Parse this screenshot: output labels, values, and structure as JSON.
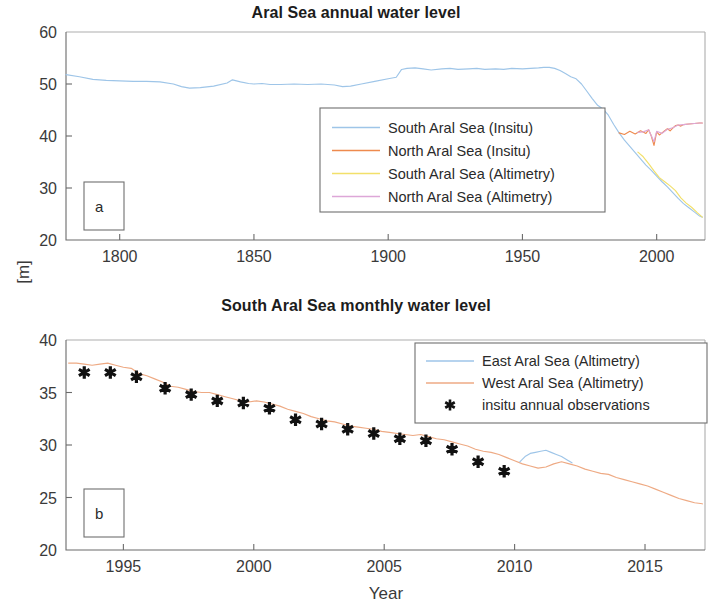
{
  "figure": {
    "ylabel": "[m]",
    "xlabel": "Year"
  },
  "panel_a": {
    "tag": "a",
    "title": "Aral Sea annual water level",
    "legend": [
      {
        "label": "South Aral Sea (Insitu)",
        "color": "#9ec5e8",
        "marker": "line"
      },
      {
        "label": "North Aral Sea (Insitu)",
        "color": "#ee8a4e",
        "marker": "line"
      },
      {
        "label": "South Aral Sea (Altimetry)",
        "color": "#f2e06a",
        "marker": "line"
      },
      {
        "label": "North Aral Sea (Altimetry)",
        "color": "#dda7d8",
        "marker": "line"
      }
    ]
  },
  "panel_b": {
    "tag": "b",
    "title": "South Aral Sea monthly water level",
    "legend": [
      {
        "label": "East Aral Sea (Altimetry)",
        "color": "#9ec5e8",
        "marker": "line"
      },
      {
        "label": "West Aral Sea (Altimetry)",
        "color": "#eeaa84",
        "marker": "line"
      },
      {
        "label": "insitu annual observations",
        "color": "#111111",
        "marker": "star"
      }
    ]
  },
  "chart_data": [
    {
      "type": "line",
      "panel": "a",
      "title": "Aral Sea annual water level",
      "xlabel": "",
      "ylabel": "[m]",
      "xlim": [
        1780,
        2018
      ],
      "ylim": [
        20,
        60
      ],
      "xticks": [
        1800,
        1850,
        1900,
        1950,
        2000
      ],
      "yticks": [
        20,
        30,
        40,
        50,
        60
      ],
      "grid": false,
      "legend_position": "center-right",
      "series": [
        {
          "name": "South Aral Sea (Insitu)",
          "color": "#9ec5e8",
          "x": [
            1780,
            1785,
            1790,
            1795,
            1800,
            1805,
            1810,
            1815,
            1820,
            1823,
            1826,
            1830,
            1835,
            1840,
            1842,
            1845,
            1848,
            1850,
            1853,
            1856,
            1860,
            1865,
            1870,
            1875,
            1880,
            1883,
            1886,
            1890,
            1895,
            1900,
            1903,
            1905,
            1907,
            1910,
            1913,
            1916,
            1920,
            1923,
            1926,
            1930,
            1933,
            1936,
            1940,
            1943,
            1946,
            1950,
            1953,
            1956,
            1958,
            1960,
            1962,
            1964,
            1966,
            1968,
            1970,
            1972,
            1974,
            1976,
            1978,
            1980,
            1982,
            1984,
            1986,
            1988,
            1990,
            1992,
            1994,
            1996,
            1998,
            2000,
            2002,
            2004,
            2006,
            2008,
            2010,
            2012,
            2014,
            2016,
            2017
          ],
          "y": [
            51.8,
            51.4,
            50.9,
            50.7,
            50.6,
            50.5,
            50.5,
            50.4,
            50.0,
            49.5,
            49.2,
            49.3,
            49.6,
            50.2,
            50.8,
            50.4,
            50.1,
            50.0,
            50.1,
            49.9,
            49.9,
            50.0,
            49.9,
            50.0,
            49.8,
            49.5,
            49.6,
            50.0,
            50.5,
            51.0,
            51.3,
            52.8,
            53.0,
            53.1,
            52.9,
            52.7,
            52.9,
            53.0,
            52.8,
            52.9,
            53.0,
            52.8,
            52.9,
            52.8,
            53.0,
            52.9,
            53.0,
            53.1,
            53.2,
            53.2,
            53.0,
            52.6,
            52.0,
            51.4,
            51.0,
            50.0,
            48.6,
            47.2,
            45.9,
            45.2,
            44.0,
            42.2,
            40.6,
            39.2,
            38.0,
            36.8,
            35.6,
            34.4,
            33.4,
            32.3,
            31.2,
            30.2,
            29.1,
            28.0,
            27.0,
            26.2,
            25.4,
            24.6,
            24.4
          ]
        },
        {
          "name": "North Aral Sea (Insitu)",
          "color": "#ee8a4e",
          "x": [
            1986,
            1988,
            1990,
            1992,
            1994,
            1996,
            1997,
            1998,
            1999,
            2000,
            2001,
            2002,
            2003,
            2004,
            2005,
            2006,
            2007,
            2008,
            2009,
            2010,
            2012,
            2014,
            2016,
            2017
          ],
          "y": [
            40.6,
            40.3,
            40.9,
            40.4,
            41.0,
            40.5,
            41.2,
            40.0,
            38.2,
            40.8,
            40.2,
            40.6,
            41.0,
            41.4,
            41.0,
            41.5,
            42.0,
            42.1,
            41.9,
            42.2,
            42.3,
            42.4,
            42.5,
            42.5
          ]
        },
        {
          "name": "South Aral Sea (Altimetry)",
          "color": "#f2e06a",
          "x": [
            1993,
            1995,
            1997,
            1999,
            2001,
            2003,
            2005,
            2007,
            2009,
            2011,
            2013,
            2015,
            2017
          ],
          "y": [
            36.9,
            36.0,
            34.7,
            33.3,
            32.0,
            31.2,
            30.4,
            29.5,
            28.1,
            27.1,
            26.3,
            25.3,
            24.4
          ]
        },
        {
          "name": "North Aral Sea (Altimetry)",
          "color": "#dda7d8",
          "x": [
            1993,
            1995,
            1997,
            1999,
            2000,
            2002,
            2004,
            2006,
            2008,
            2010,
            2012,
            2014,
            2016,
            2017
          ],
          "y": [
            40.7,
            40.8,
            41.2,
            38.9,
            40.9,
            40.5,
            41.3,
            41.6,
            42.1,
            42.2,
            42.3,
            42.4,
            42.5,
            42.5
          ]
        }
      ]
    },
    {
      "type": "line",
      "panel": "b",
      "title": "South Aral Sea monthly water level",
      "xlabel": "Year",
      "ylabel": "[m]",
      "xlim": [
        1992.8,
        2017.3
      ],
      "ylim": [
        20,
        40
      ],
      "xticks": [
        1995,
        2000,
        2005,
        2010,
        2015
      ],
      "yticks": [
        20,
        25,
        30,
        35,
        40
      ],
      "grid": false,
      "legend_position": "top-right",
      "series": [
        {
          "name": "West Aral Sea (Altimetry)",
          "color": "#eeaa84",
          "x": [
            1992.9,
            1993.2,
            1993.5,
            1993.8,
            1994.1,
            1994.4,
            1994.7,
            1995.0,
            1995.3,
            1995.6,
            1995.9,
            1996.2,
            1996.5,
            1996.8,
            1997.1,
            1997.4,
            1997.7,
            1998.0,
            1998.3,
            1998.6,
            1998.9,
            1999.2,
            1999.5,
            1999.8,
            2000.1,
            2000.4,
            2000.7,
            2001.0,
            2001.3,
            2001.6,
            2001.9,
            2002.2,
            2002.5,
            2002.8,
            2003.1,
            2003.4,
            2003.7,
            2004.0,
            2004.3,
            2004.6,
            2004.9,
            2005.2,
            2005.5,
            2005.8,
            2006.1,
            2006.4,
            2006.7,
            2007.0,
            2007.3,
            2007.6,
            2007.9,
            2008.2,
            2008.5,
            2008.8,
            2009.1,
            2009.4,
            2009.7,
            2010.0,
            2010.3,
            2010.6,
            2010.9,
            2011.2,
            2011.5,
            2011.8,
            2012.1,
            2012.4,
            2012.7,
            2013.0,
            2013.3,
            2013.6,
            2013.9,
            2014.2,
            2014.5,
            2014.8,
            2015.1,
            2015.4,
            2015.7,
            2016.0,
            2016.3,
            2016.6,
            2016.9,
            2017.2
          ],
          "y": [
            37.8,
            37.8,
            37.7,
            37.6,
            37.7,
            37.8,
            37.6,
            37.4,
            37.3,
            36.8,
            36.6,
            36.3,
            36.0,
            35.6,
            35.5,
            35.3,
            35.1,
            35.0,
            35.0,
            34.8,
            34.6,
            34.4,
            34.2,
            34.1,
            34.2,
            34.1,
            33.9,
            33.7,
            33.4,
            33.2,
            33.0,
            32.7,
            32.5,
            32.3,
            32.2,
            32.0,
            31.8,
            31.7,
            31.6,
            31.5,
            31.3,
            31.2,
            31.1,
            31.0,
            30.9,
            31.0,
            30.8,
            30.6,
            30.5,
            30.3,
            30.1,
            29.9,
            29.6,
            29.4,
            29.3,
            29.1,
            28.8,
            28.5,
            28.2,
            28.0,
            27.8,
            27.9,
            28.2,
            28.4,
            28.2,
            28.0,
            27.7,
            27.5,
            27.3,
            27.2,
            26.9,
            26.7,
            26.5,
            26.3,
            26.1,
            25.8,
            25.5,
            25.2,
            24.9,
            24.7,
            24.5,
            24.4
          ]
        },
        {
          "name": "East Aral Sea (Altimetry)",
          "color": "#9ec5e8",
          "x": [
            2010.2,
            2010.4,
            2010.6,
            2010.8,
            2011.0,
            2011.2,
            2011.4,
            2011.6,
            2011.8,
            2012.0,
            2012.2
          ],
          "y": [
            28.4,
            28.9,
            29.2,
            29.3,
            29.4,
            29.5,
            29.3,
            29.1,
            28.9,
            28.6,
            28.3
          ]
        }
      ],
      "markers": {
        "name": "insitu annual observations",
        "color": "#111111",
        "x": [
          1993.5,
          1994.5,
          1995.5,
          1996.6,
          1997.6,
          1998.6,
          1999.6,
          2000.6,
          2001.6,
          2002.6,
          2003.6,
          2004.6,
          2005.6,
          2006.6,
          2007.6,
          2008.6,
          2009.6
        ],
        "y": [
          36.9,
          36.9,
          36.5,
          35.4,
          34.8,
          34.2,
          34.0,
          33.5,
          32.4,
          32.0,
          31.5,
          31.1,
          30.6,
          30.4,
          29.6,
          28.4,
          27.5
        ]
      }
    }
  ]
}
